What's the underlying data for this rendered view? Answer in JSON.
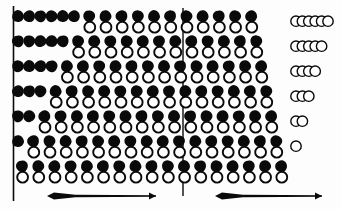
{
  "figure": {
    "title": "",
    "background_color": "#fdfdfd",
    "ink_color": "#0a0a0a",
    "open_fill_color": "#ffffff",
    "width": 341,
    "height": 209
  },
  "rules": [
    {
      "name": "left-rule",
      "x": 13.5,
      "y1": 6,
      "y2": 201,
      "width": 1.6
    },
    {
      "name": "center-rule",
      "x": 183,
      "y1": 8,
      "y2": 196,
      "width": 1.4
    }
  ],
  "grid": {
    "row_count": 7,
    "column_count": 17,
    "row_tops": [
      10,
      35,
      60,
      85,
      110,
      135,
      160
    ],
    "row_pitch": 25,
    "column_left": 18,
    "column_pitch": 16.2,
    "solid_radius": 6.2,
    "open_radius": 5.4,
    "open_offset_y": 11,
    "tight_pitch": 11.2
  },
  "rows": [
    {
      "index": 1,
      "label": "row-1",
      "tight_solids": 6,
      "pairs": 11,
      "cluster_count": 6
    },
    {
      "index": 2,
      "label": "row-2",
      "tight_solids": 5,
      "pairs": 12,
      "cluster_count": 5
    },
    {
      "index": 3,
      "label": "row-3",
      "tight_solids": 4,
      "pairs": 13,
      "cluster_count": 4
    },
    {
      "index": 4,
      "label": "row-4",
      "tight_solids": 3,
      "pairs": 14,
      "cluster_count": 3
    },
    {
      "index": 5,
      "label": "row-5",
      "tight_solids": 2,
      "pairs": 15,
      "cluster_count": 2
    },
    {
      "index": 6,
      "label": "row-6",
      "tight_solids": 1,
      "pairs": 16,
      "cluster_count": 1
    },
    {
      "index": 7,
      "label": "row-7",
      "tight_solids": 0,
      "pairs": 17,
      "cluster_count": 0
    }
  ],
  "clusters": {
    "name": "open-circle-cluster",
    "left": 296,
    "overlap_pitch": 6.4,
    "radius": 5.2,
    "outline_width": 1.4
  },
  "arrows": [
    {
      "name": "left-arrow",
      "label": "",
      "x1": 47,
      "x2": 156,
      "y": 196,
      "head_left": true,
      "head_right": true,
      "tail_thickness": 7
    },
    {
      "name": "right-arrow",
      "label": "",
      "x1": 215,
      "x2": 322,
      "y": 196,
      "head_left": true,
      "head_right": true,
      "tail_thickness": 7
    }
  ],
  "legend": {
    "items": []
  },
  "annotations": []
}
